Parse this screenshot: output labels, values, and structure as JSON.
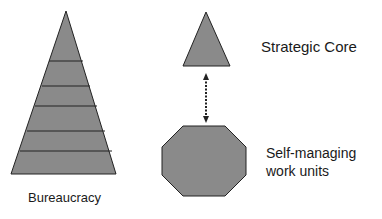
{
  "labels": {
    "bureaucracy": "Bureaucracy",
    "strategic_core": "Strategic Core",
    "self_managing_line1": "Self-managing",
    "self_managing_line2": "work units"
  },
  "colors": {
    "fill": "#8a8a8a",
    "stroke": "#222222"
  }
}
